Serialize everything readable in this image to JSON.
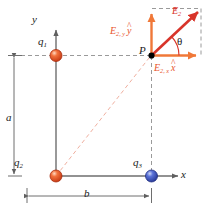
{
  "figure": {
    "type": "physics-vector-diagram",
    "background_color": "#ffffff"
  },
  "colors": {
    "positive_charge": "#e0401c",
    "negative_charge": "#3a52c8",
    "resultant_vector": "#d8342a",
    "component_vector": "#f07838",
    "component_label": "#e8542a",
    "axis": "#6e6e6e",
    "dimension_line": "#6e6e6e",
    "construction_dash": "#9a9a9a",
    "field_dash": "#f0b0a0",
    "point_marker": "#000000",
    "text": "#1a1a1a"
  },
  "axes": {
    "x_label": "x",
    "y_label": "y",
    "origin_note": ""
  },
  "charges": [
    {
      "id": "q1",
      "label": "q",
      "subscript": "1",
      "sign": "positive",
      "color": "#e0401c"
    },
    {
      "id": "q2",
      "label": "q",
      "subscript": "2",
      "sign": "positive",
      "color": "#e0401c"
    },
    {
      "id": "q3",
      "label": "q",
      "subscript": "3",
      "sign": "negative",
      "color": "#3a52c8"
    }
  ],
  "point": {
    "label": "P"
  },
  "angle": {
    "label": "θ"
  },
  "vectors": {
    "resultant": {
      "symbol": "E",
      "subscript": "2",
      "accent": "arrow",
      "color": "#d8342a"
    },
    "y_component": {
      "symbol": "E",
      "subscript": "2, y",
      "unit_vector": "y",
      "accent": "hat",
      "color": "#f07838"
    },
    "x_component": {
      "symbol": "E",
      "subscript": "2, x",
      "unit_vector": "x",
      "accent": "hat",
      "color": "#f07838"
    }
  },
  "dimensions": [
    {
      "id": "a",
      "label": "a",
      "orientation": "vertical"
    },
    {
      "id": "b",
      "label": "b",
      "orientation": "horizontal"
    }
  ]
}
